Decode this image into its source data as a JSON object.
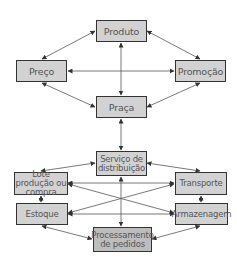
{
  "colors": {
    "box_fill": "#d2d2d2",
    "box_fill_dark": "#bdbdbd",
    "border": "#333333",
    "line": "#444444",
    "text": "#555555"
  },
  "nodes": {
    "produto": "Produto",
    "preco": "Preço",
    "promocao": "Promoção",
    "praca": "Praça",
    "servico": "Serviço de distribuição",
    "lote": "Lote produção ou compra",
    "transporte": "Transporte",
    "estoque": "Estoque",
    "armazenagem": "Armazenagem",
    "processamento": "Processamento de pedidos"
  },
  "edges": [
    [
      "produto",
      "preco"
    ],
    [
      "produto",
      "promocao"
    ],
    [
      "produto",
      "praca"
    ],
    [
      "preco",
      "promocao"
    ],
    [
      "preco",
      "praca"
    ],
    [
      "promocao",
      "praca"
    ],
    [
      "praca",
      "servico"
    ],
    [
      "servico",
      "lote"
    ],
    [
      "servico",
      "transporte"
    ],
    [
      "servico",
      "processamento"
    ],
    [
      "lote",
      "transporte"
    ],
    [
      "lote",
      "armazenagem"
    ],
    [
      "lote",
      "estoque"
    ],
    [
      "transporte",
      "estoque"
    ],
    [
      "transporte",
      "armazenagem"
    ],
    [
      "estoque",
      "armazenagem"
    ],
    [
      "estoque",
      "processamento"
    ],
    [
      "armazenagem",
      "processamento"
    ]
  ]
}
